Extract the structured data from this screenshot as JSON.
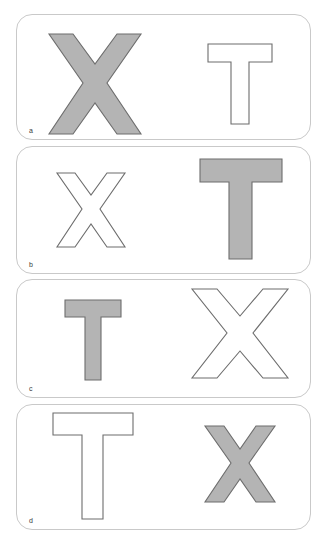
{
  "figure": {
    "type": "shape-stimulus-sheet",
    "panel_count": 4,
    "background_color": "#ffffff",
    "panel_border_color": "#c9c9c9",
    "shape_fill_gray": "#b4b4b4",
    "shape_outline_color": "#6d6d6d",
    "shape_outline_white": "#ffffff"
  },
  "panels": [
    {
      "label": "a",
      "left_shape": {
        "letter": "X",
        "style": "filled",
        "size": "large",
        "fill": "#b4b4b4",
        "stroke": "#6d6d6d"
      },
      "right_shape": {
        "letter": "T",
        "style": "outline",
        "size": "medium",
        "fill": "#ffffff",
        "stroke": "#6d6d6d"
      }
    },
    {
      "label": "b",
      "left_shape": {
        "letter": "X",
        "style": "outline",
        "size": "medium",
        "fill": "#ffffff",
        "stroke": "#6d6d6d"
      },
      "right_shape": {
        "letter": "T",
        "style": "filled",
        "size": "large",
        "fill": "#b4b4b4",
        "stroke": "#6d6d6d"
      }
    },
    {
      "label": "c",
      "left_shape": {
        "letter": "T",
        "style": "filled",
        "size": "small",
        "fill": "#b4b4b4",
        "stroke": "#6d6d6d"
      },
      "right_shape": {
        "letter": "X",
        "style": "outline",
        "size": "large",
        "fill": "#ffffff",
        "stroke": "#6d6d6d"
      }
    },
    {
      "label": "d",
      "left_shape": {
        "letter": "T",
        "style": "outline",
        "size": "large",
        "fill": "#ffffff",
        "stroke": "#6d6d6d"
      },
      "right_shape": {
        "letter": "X",
        "style": "filled",
        "size": "medium",
        "fill": "#b4b4b4",
        "stroke": "#6d6d6d"
      }
    }
  ]
}
